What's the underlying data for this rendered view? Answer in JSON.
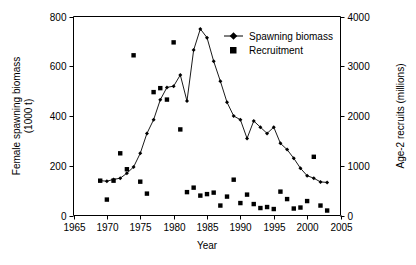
{
  "chart_data": {
    "type": "scatter",
    "title": "",
    "xlabel": "Year",
    "ylabel": "Female spawning biomass (1000 t)",
    "y2label": "Age-2 recruits (millions)",
    "xlim": [
      1965,
      2005
    ],
    "ylim": [
      0,
      800
    ],
    "y2lim": [
      0,
      4000
    ],
    "xticks": [
      1965,
      1970,
      1975,
      1980,
      1985,
      1990,
      1995,
      2000,
      2005
    ],
    "yticks": [
      0,
      200,
      400,
      600,
      800
    ],
    "y2ticks": [
      0,
      1000,
      2000,
      3000,
      4000
    ],
    "grid": false,
    "legend_position": "top-right",
    "series": [
      {
        "name": "Spawning biomass",
        "marker": "diamond-line",
        "axis": "left",
        "x": [
          1969,
          1970,
          1971,
          1972,
          1973,
          1974,
          1975,
          1976,
          1977,
          1978,
          1979,
          1980,
          1981,
          1982,
          1983,
          1984,
          1985,
          1986,
          1987,
          1988,
          1989,
          1990,
          1991,
          1992,
          1993,
          1994,
          1995,
          1996,
          1997,
          1998,
          1999,
          2000,
          2001,
          2002,
          2003
        ],
        "values": [
          140,
          138,
          145,
          150,
          170,
          195,
          250,
          330,
          385,
          465,
          515,
          520,
          565,
          460,
          665,
          750,
          715,
          620,
          540,
          455,
          400,
          385,
          310,
          380,
          355,
          330,
          355,
          290,
          265,
          230,
          190,
          160,
          150,
          135,
          133
        ]
      },
      {
        "name": "Recruitment",
        "marker": "square",
        "axis": "right",
        "x": [
          1969,
          1970,
          1971,
          1972,
          1973,
          1974,
          1975,
          1976,
          1977,
          1978,
          1979,
          1980,
          1981,
          1982,
          1983,
          1984,
          1985,
          1986,
          1987,
          1988,
          1989,
          1990,
          1991,
          1992,
          1993,
          1994,
          1995,
          1996,
          1997,
          1998,
          1999,
          2000,
          2001,
          2002,
          2003
        ],
        "values": [
          700,
          320,
          700,
          1250,
          930,
          3220,
          680,
          440,
          2480,
          2560,
          2330,
          3480,
          1730,
          470,
          560,
          400,
          430,
          460,
          200,
          380,
          720,
          250,
          420,
          230,
          150,
          170,
          130,
          480,
          330,
          140,
          160,
          290,
          1180,
          200,
          100
        ]
      }
    ]
  },
  "legend": {
    "items": [
      {
        "label": "Spawning biomass",
        "marker": "diamond-line"
      },
      {
        "label": "Recruitment",
        "marker": "square"
      }
    ]
  },
  "axes": {
    "x_label": "Year",
    "y_left_label_line1": "Female spawning biomass",
    "y_left_label_line2": "(1000 t)",
    "y_right_label": "Age-2 recruits (millions)",
    "x_tick_labels": [
      "1965",
      "1970",
      "1975",
      "1980",
      "1985",
      "1990",
      "1995",
      "2000",
      "2005"
    ],
    "y_left_tick_labels": [
      "0",
      "200",
      "400",
      "600",
      "800"
    ],
    "y_right_tick_labels": [
      "0",
      "1000",
      "2000",
      "3000",
      "4000"
    ]
  },
  "colors": {
    "axis": "#000000",
    "marker": "#000000",
    "line": "#000000",
    "background": "#ffffff"
  }
}
